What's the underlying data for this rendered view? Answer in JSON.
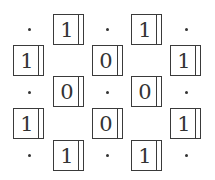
{
  "diagram": {
    "cells": [
      {
        "row": 0,
        "col": 1,
        "value": "1",
        "x": 53,
        "y": 14
      },
      {
        "row": 0,
        "col": 3,
        "value": "1",
        "x": 131,
        "y": 14
      },
      {
        "row": 1,
        "col": 0,
        "value": "1",
        "x": 13,
        "y": 45
      },
      {
        "row": 1,
        "col": 2,
        "value": "0",
        "x": 92,
        "y": 45
      },
      {
        "row": 1,
        "col": 4,
        "value": "1",
        "x": 170,
        "y": 45
      },
      {
        "row": 2,
        "col": 1,
        "value": "0",
        "x": 53,
        "y": 76
      },
      {
        "row": 2,
        "col": 3,
        "value": "0",
        "x": 131,
        "y": 76
      },
      {
        "row": 3,
        "col": 0,
        "value": "1",
        "x": 13,
        "y": 108
      },
      {
        "row": 3,
        "col": 2,
        "value": "0",
        "x": 92,
        "y": 108
      },
      {
        "row": 3,
        "col": 4,
        "value": "1",
        "x": 170,
        "y": 108
      },
      {
        "row": 4,
        "col": 1,
        "value": "1",
        "x": 53,
        "y": 140
      },
      {
        "row": 4,
        "col": 3,
        "value": "1",
        "x": 131,
        "y": 140
      }
    ],
    "dots": [
      {
        "x": 29,
        "y": 29
      },
      {
        "x": 107,
        "y": 29
      },
      {
        "x": 186,
        "y": 29
      },
      {
        "x": 29,
        "y": 92
      },
      {
        "x": 107,
        "y": 92
      },
      {
        "x": 186,
        "y": 92
      },
      {
        "x": 29,
        "y": 155
      },
      {
        "x": 107,
        "y": 155
      },
      {
        "x": 186,
        "y": 155
      }
    ],
    "colors": {
      "stroke": "#3a3a3a",
      "text": "#333333",
      "background": "#ffffff"
    }
  }
}
